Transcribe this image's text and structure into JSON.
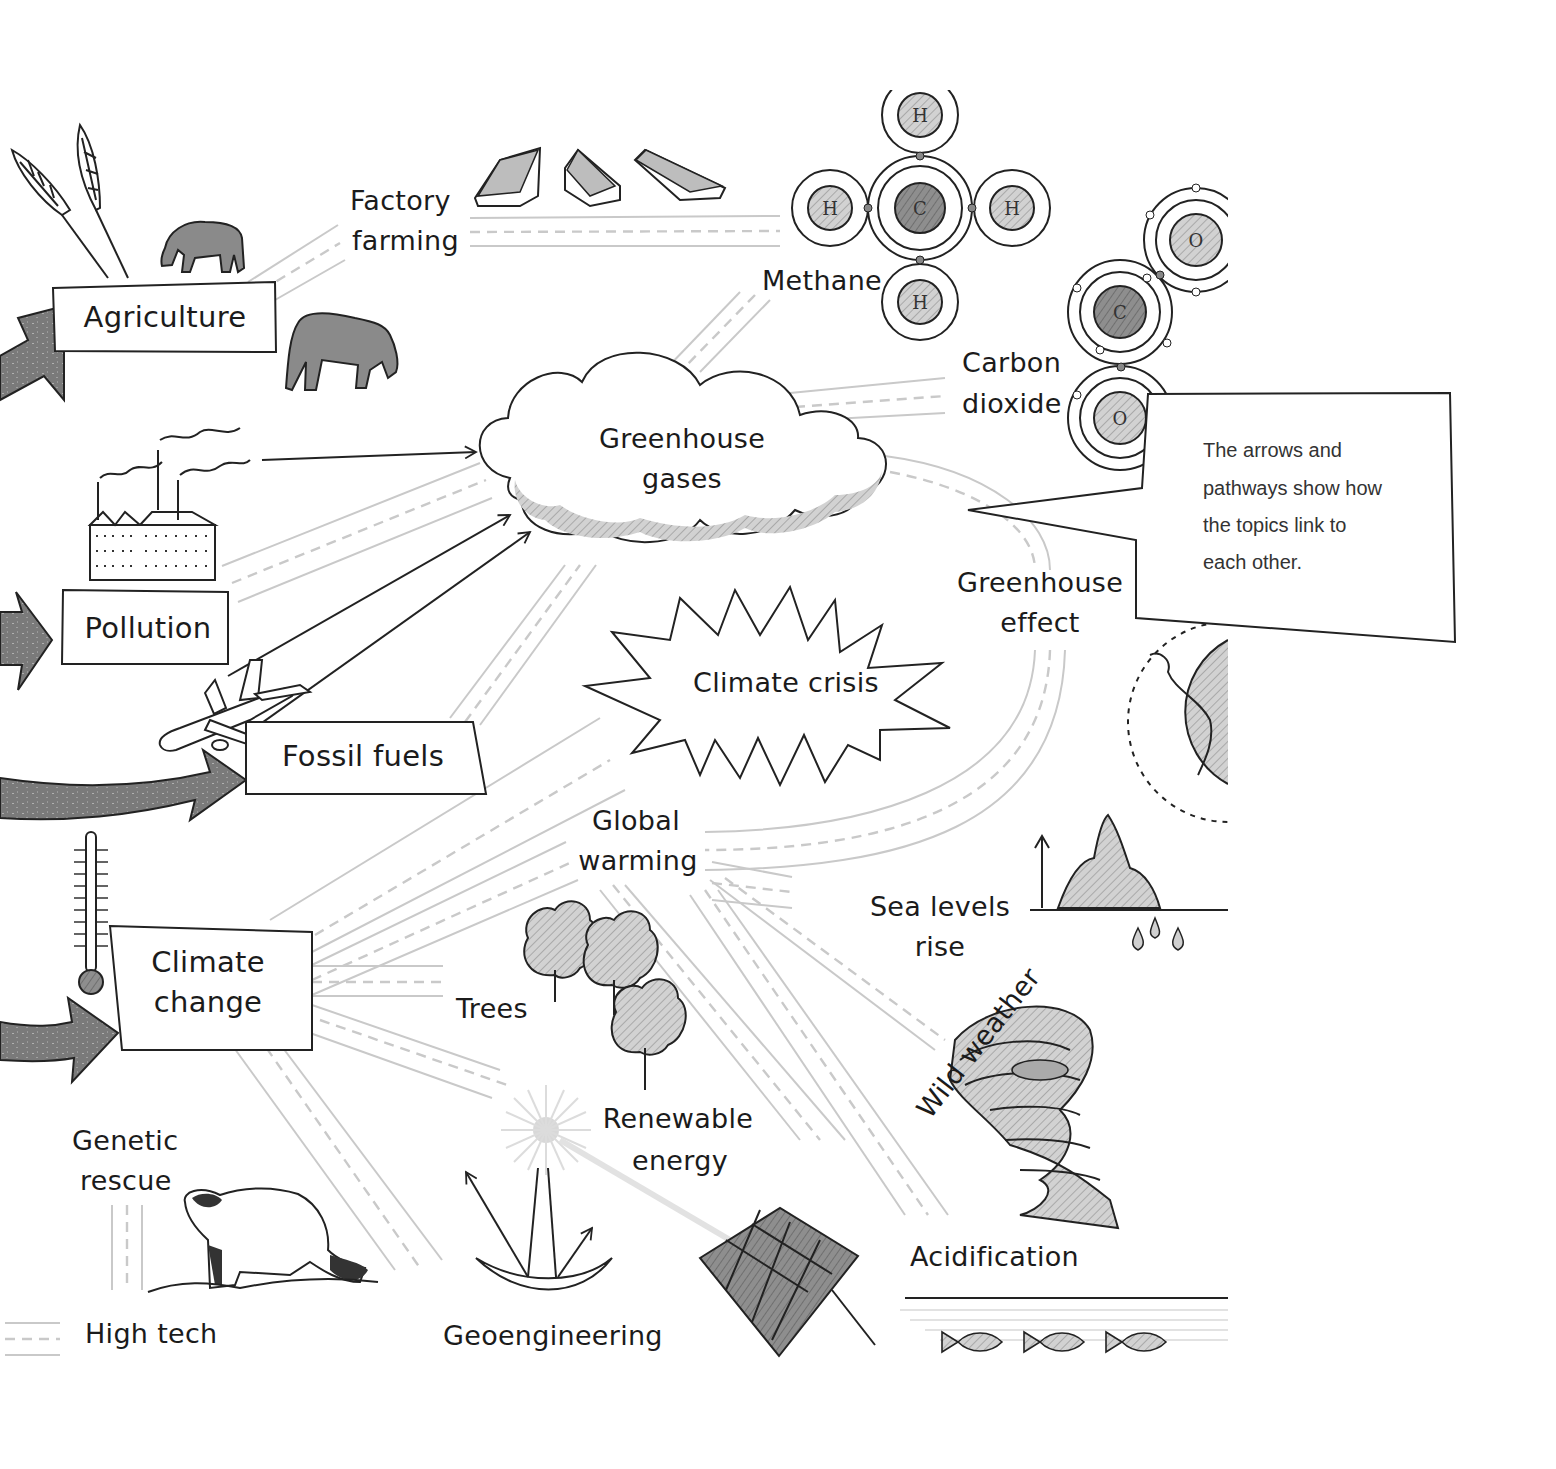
{
  "diagram": {
    "nodes": {
      "agriculture": "Agriculture",
      "factory_farming_line1": "Factory",
      "factory_farming_line2": "farming",
      "methane": "Methane",
      "carbon_dioxide_line1": "Carbon",
      "carbon_dioxide_line2": "dioxide",
      "greenhouse_gases_line1": "Greenhouse",
      "greenhouse_gases_line2": "gases",
      "pollution": "Pollution",
      "fossil_fuels": "Fossil fuels",
      "climate_crisis": "Climate crisis",
      "greenhouse_effect_line1": "Greenhouse",
      "greenhouse_effect_line2": "effect",
      "global_warming_line1": "Global",
      "global_warming_line2": "warming",
      "sea_levels_line1": "Sea levels",
      "sea_levels_line2": "rise",
      "climate_change_line1": "Climate",
      "climate_change_line2": "change",
      "trees": "Trees",
      "renewable_energy_line1": "Renewable",
      "renewable_energy_line2": "energy",
      "wild_weather": "Wild weather",
      "genetic_rescue_line1": "Genetic",
      "genetic_rescue_line2": "rescue",
      "high_tech": "High tech",
      "geoengineering": "Geoengineering",
      "acidification": "Acidification"
    },
    "molecules": {
      "methane_atoms": {
        "center": "C",
        "hydrogen": "H"
      },
      "co2_atoms": {
        "carbon": "C",
        "oxygen": "O"
      }
    },
    "callout": {
      "line1": "The arrows and",
      "line2": "pathways show how",
      "line3": "the topics link to",
      "line4": "each other."
    },
    "colors": {
      "ink": "#222222",
      "road": "#c9c9c9",
      "shade": "#8a8a8a",
      "light_shade": "#d6d6d6"
    }
  }
}
